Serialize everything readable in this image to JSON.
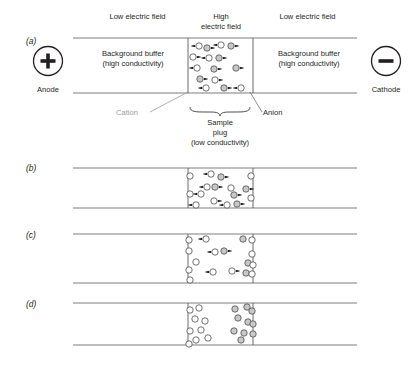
{
  "figure": {
    "title_alt": "Electrophoretic stacking of ions in a sample plug",
    "panels": [
      {
        "id": "(a)",
        "label": "(a)"
      },
      {
        "id": "(b)",
        "label": "(b)"
      },
      {
        "id": "(c)",
        "label": "(c)"
      },
      {
        "id": "(d)",
        "label": "(d)"
      }
    ]
  },
  "electrodes": {
    "anode": {
      "symbol": "+",
      "label": "Anode",
      "icon": "plus-circle-icon"
    },
    "cathode": {
      "symbol": "–",
      "label": "Cathode",
      "icon": "minus-circle-icon"
    }
  },
  "field_labels": {
    "left": "Low electric field",
    "center_line1": "High",
    "center_line2": "electric field",
    "right": "Low electric field"
  },
  "region_labels": {
    "buffer_left_line1": "Background buffer",
    "buffer_left_line2": "(high conductivity)",
    "buffer_right_line1": "Background buffer",
    "buffer_right_line2": "(high conductivity)",
    "plug_line1": "Sample",
    "plug_line2": "plug",
    "plug_line3": "(low conductivity)"
  },
  "ion_labels": {
    "cation": "Cation",
    "anion": "Anion",
    "cation_color": "#9b9b9b",
    "anion_color": "#231f20"
  },
  "colors": {
    "ink": "#231f20",
    "channel_line": "#6d6e71",
    "plug_line": "#58595b",
    "cation_fill": "#ffffff",
    "anion_fill": "#c8c8c8",
    "leader_line": "#9b9b9b",
    "background": "#ffffff"
  },
  "geometry": {
    "channel_left": 73,
    "channel_right": 357,
    "plug_left": 188,
    "plug_right": 253,
    "panels_y": [
      {
        "top": 38,
        "bottom": 93
      },
      {
        "top": 168,
        "bottom": 208
      },
      {
        "top": 234,
        "bottom": 283
      },
      {
        "top": 303,
        "bottom": 345
      }
    ]
  },
  "particles": {
    "panel_a": [
      {
        "x": 199,
        "y": 46,
        "t": "open",
        "arrow": "left"
      },
      {
        "x": 207,
        "y": 48,
        "t": "gray",
        "arrow": "right"
      },
      {
        "x": 221,
        "y": 45,
        "t": "open",
        "arrow": "left"
      },
      {
        "x": 231,
        "y": 46,
        "t": "gray",
        "arrow": "right"
      },
      {
        "x": 193,
        "y": 57,
        "t": "open",
        "arrow": "right"
      },
      {
        "x": 209,
        "y": 58,
        "t": "open",
        "arrow": "left"
      },
      {
        "x": 219,
        "y": 58,
        "t": "gray",
        "arrow": "right"
      },
      {
        "x": 197,
        "y": 68,
        "t": "open",
        "arrow": "left"
      },
      {
        "x": 214,
        "y": 69,
        "t": "gray",
        "arrow": "right"
      },
      {
        "x": 236,
        "y": 68,
        "t": "gray",
        "arrow": "right"
      },
      {
        "x": 200,
        "y": 79,
        "t": "gray",
        "arrow": "right"
      },
      {
        "x": 215,
        "y": 80,
        "t": "open",
        "arrow": "right"
      },
      {
        "x": 206,
        "y": 88,
        "t": "open",
        "arrow": "left"
      },
      {
        "x": 224,
        "y": 88,
        "t": "gray",
        "arrow": "right"
      },
      {
        "x": 241,
        "y": 88,
        "t": "open",
        "arrow": "left"
      }
    ],
    "panel_b": [
      {
        "x": 190,
        "y": 176,
        "t": "open",
        "arrow": "none"
      },
      {
        "x": 211,
        "y": 174,
        "t": "open",
        "arrow": "left"
      },
      {
        "x": 221,
        "y": 177,
        "t": "gray",
        "arrow": "right"
      },
      {
        "x": 251,
        "y": 176,
        "t": "open",
        "arrow": "none"
      },
      {
        "x": 207,
        "y": 187,
        "t": "open",
        "arrow": "left"
      },
      {
        "x": 215,
        "y": 187,
        "t": "gray",
        "arrow": "right"
      },
      {
        "x": 231,
        "y": 188,
        "t": "open",
        "arrow": "none"
      },
      {
        "x": 246,
        "y": 189,
        "t": "gray",
        "arrow": "right"
      },
      {
        "x": 190,
        "y": 194,
        "t": "open",
        "arrow": "none"
      },
      {
        "x": 201,
        "y": 194,
        "t": "open",
        "arrow": "left"
      },
      {
        "x": 234,
        "y": 195,
        "t": "gray",
        "arrow": "right"
      },
      {
        "x": 251,
        "y": 198,
        "t": "open",
        "arrow": "none"
      },
      {
        "x": 214,
        "y": 201,
        "t": "open",
        "arrow": "right"
      },
      {
        "x": 196,
        "y": 205,
        "t": "open",
        "arrow": "left"
      },
      {
        "x": 227,
        "y": 205,
        "t": "open",
        "arrow": "left"
      },
      {
        "x": 237,
        "y": 204,
        "t": "gray",
        "arrow": "right"
      }
    ],
    "panel_c": [
      {
        "x": 189,
        "y": 240,
        "t": "open",
        "arrow": "none"
      },
      {
        "x": 206,
        "y": 239,
        "t": "open",
        "arrow": "left"
      },
      {
        "x": 243,
        "y": 239,
        "t": "gray",
        "arrow": "none"
      },
      {
        "x": 252,
        "y": 240,
        "t": "open",
        "arrow": "none"
      },
      {
        "x": 189,
        "y": 251,
        "t": "open",
        "arrow": "none"
      },
      {
        "x": 215,
        "y": 252,
        "t": "open",
        "arrow": "left"
      },
      {
        "x": 224,
        "y": 251,
        "t": "gray",
        "arrow": "right"
      },
      {
        "x": 252,
        "y": 254,
        "t": "open",
        "arrow": "none"
      },
      {
        "x": 196,
        "y": 262,
        "t": "open",
        "arrow": "none"
      },
      {
        "x": 248,
        "y": 263,
        "t": "gray",
        "arrow": "none"
      },
      {
        "x": 253,
        "y": 265,
        "t": "open",
        "arrow": "none"
      },
      {
        "x": 189,
        "y": 270,
        "t": "open",
        "arrow": "none"
      },
      {
        "x": 213,
        "y": 272,
        "t": "open",
        "arrow": "left"
      },
      {
        "x": 232,
        "y": 271,
        "t": "open",
        "arrow": "right"
      },
      {
        "x": 246,
        "y": 273,
        "t": "gray",
        "arrow": "none"
      },
      {
        "x": 252,
        "y": 274,
        "t": "open",
        "arrow": "none"
      },
      {
        "x": 190,
        "y": 280,
        "t": "open",
        "arrow": "none"
      }
    ],
    "panel_d": [
      {
        "x": 190,
        "y": 310,
        "t": "open",
        "arrow": "none"
      },
      {
        "x": 199,
        "y": 308,
        "t": "open",
        "arrow": "none"
      },
      {
        "x": 235,
        "y": 309,
        "t": "gray",
        "arrow": "none"
      },
      {
        "x": 247,
        "y": 307,
        "t": "gray",
        "arrow": "none"
      },
      {
        "x": 252,
        "y": 311,
        "t": "gray",
        "arrow": "none"
      },
      {
        "x": 195,
        "y": 319,
        "t": "open",
        "arrow": "none"
      },
      {
        "x": 205,
        "y": 321,
        "t": "open",
        "arrow": "none"
      },
      {
        "x": 238,
        "y": 318,
        "t": "gray",
        "arrow": "none"
      },
      {
        "x": 248,
        "y": 322,
        "t": "gray",
        "arrow": "none"
      },
      {
        "x": 253,
        "y": 324,
        "t": "gray",
        "arrow": "none"
      },
      {
        "x": 190,
        "y": 331,
        "t": "open",
        "arrow": "none"
      },
      {
        "x": 201,
        "y": 330,
        "t": "open",
        "arrow": "none"
      },
      {
        "x": 234,
        "y": 331,
        "t": "gray",
        "arrow": "none"
      },
      {
        "x": 244,
        "y": 333,
        "t": "gray",
        "arrow": "none"
      },
      {
        "x": 253,
        "y": 334,
        "t": "gray",
        "arrow": "none"
      },
      {
        "x": 196,
        "y": 340,
        "t": "open",
        "arrow": "none"
      },
      {
        "x": 208,
        "y": 338,
        "t": "open",
        "arrow": "none"
      },
      {
        "x": 241,
        "y": 340,
        "t": "gray",
        "arrow": "none"
      },
      {
        "x": 189,
        "y": 344,
        "t": "open",
        "arrow": "none"
      }
    ]
  }
}
